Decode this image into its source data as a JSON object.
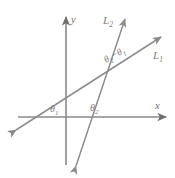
{
  "figure": {
    "background_color": "#ffffff",
    "line_color": "#8a8a8a",
    "axis_color": "#8a8a8a",
    "label_color": "#7e7e7e"
  },
  "axes": {
    "x_label": "x",
    "y_label": "y",
    "origin": {
      "x": 66,
      "y": 117
    },
    "x_axis": {
      "x1": 18,
      "y1": 117,
      "x2": 168,
      "y2": 117
    },
    "y_axis": {
      "x1": 66,
      "y1": 165,
      "x2": 66,
      "y2": 15
    }
  },
  "lines": [
    {
      "name": "L1",
      "label": "L",
      "label_sub": "1",
      "label_pos": {
        "x": 153,
        "y": 58
      },
      "x_intercept": {
        "x": 37,
        "y": 117
      },
      "start": {
        "x": 13,
        "y": 132
      },
      "end": {
        "x": 164,
        "y": 34
      },
      "angle_symbol": "θ",
      "angle_sub": "1"
    },
    {
      "name": "L2",
      "label": "L",
      "label_sub": "2",
      "label_pos": {
        "x": 103,
        "y": 23
      },
      "x_intercept": {
        "x": 88,
        "y": 117
      },
      "start": {
        "x": 74,
        "y": 170
      },
      "end": {
        "x": 127,
        "y": 15
      },
      "angle_symbol": "θ",
      "angle_sub": "2"
    }
  ],
  "angles": [
    {
      "id": "theta-1",
      "symbol": "θ",
      "subscript": "1",
      "position": {
        "x": 51,
        "y": 110
      },
      "description": "inclination angle of L1 with positive x-axis"
    },
    {
      "id": "theta-2",
      "symbol": "θ",
      "subscript": "2",
      "position": {
        "x": 91,
        "y": 109
      },
      "description": "inclination angle of L2 with positive x-axis"
    }
  ],
  "difference_label": {
    "id": "theta-2-minus-theta-1",
    "symbol_a": "θ",
    "sub_a": "2",
    "operator": "−",
    "symbol_b": "θ",
    "sub_b": "1",
    "position": {
      "x": 106,
      "y": 62
    },
    "rotation": -29,
    "description": "angle between L1 and L2 at their intersection"
  },
  "intersection": {
    "x": 101,
    "y": 78
  }
}
